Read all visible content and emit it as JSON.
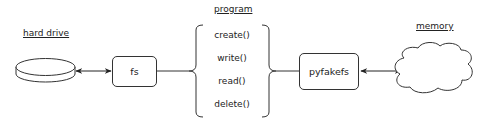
{
  "diagram": {
    "title_labels": {
      "hard_drive": "hard drive",
      "program": "program",
      "memory": "memory"
    },
    "nodes": {
      "hard_drive": {
        "shape": "disk",
        "label": ""
      },
      "fs": {
        "shape": "rounded-rect",
        "label": "fs"
      },
      "program": {
        "shape": "curly-braces",
        "methods": [
          "create()",
          "write()",
          "read()",
          "delete()"
        ]
      },
      "pyfakefs": {
        "shape": "rounded-rect",
        "label": "pyfakefs"
      },
      "memory": {
        "shape": "cloud",
        "label": ""
      }
    },
    "edges": [
      {
        "from": "hard_drive",
        "to": "fs",
        "style": "double-arrow"
      },
      {
        "from": "fs",
        "to": "program",
        "style": "line"
      },
      {
        "from": "program",
        "to": "pyfakefs",
        "style": "line"
      },
      {
        "from": "pyfakefs",
        "to": "memory",
        "style": "double-arrow"
      }
    ],
    "colors": {
      "stroke": "#333333",
      "text": "#222222",
      "background": "#ffffff"
    }
  }
}
